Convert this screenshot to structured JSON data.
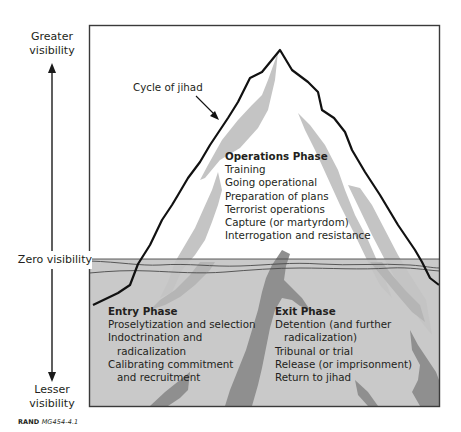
{
  "figure": {
    "axis": {
      "top_label": "Greater visibility",
      "top_label_lines": [
        "Greater",
        "visibility"
      ],
      "middle_label": "Zero visibility",
      "bottom_label": "Lesser visibility",
      "bottom_label_lines": [
        "Lesser",
        "visibility"
      ]
    },
    "callout": {
      "label": "Cycle of jihad"
    },
    "operations_phase": {
      "title": "Operations Phase",
      "items": [
        "Training",
        "Going operational",
        "Preparation of plans",
        "Terrorist operations",
        "Capture (or martyrdom)",
        "Interrogation and resistance"
      ]
    },
    "entry_phase": {
      "title": "Entry Phase",
      "items": [
        "Proselytization and selection",
        "Indoctrination and",
        "radicalization",
        "Calibrating commitment",
        "and recruitment"
      ]
    },
    "exit_phase": {
      "title": "Exit Phase",
      "items": [
        "Detention (and further",
        "radicalization)",
        "Tribunal or trial",
        "Release (or imprisonment)",
        "Return to jihad"
      ]
    },
    "credit": {
      "org": "RAND",
      "id": "MG454-4.1"
    },
    "colors": {
      "water": "#c8c8c8",
      "light_band": "#bdbdbd",
      "dark_band": "#8a8a8a",
      "outline": "#1a1a1a",
      "border": "#3a3a3a"
    }
  }
}
